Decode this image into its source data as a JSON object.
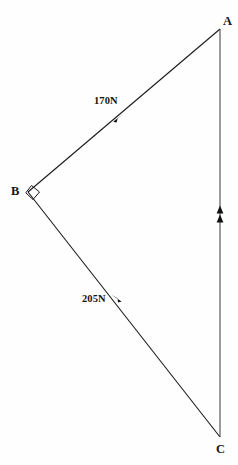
{
  "figure": {
    "background_color": "#fefefe",
    "stroke_color": "#1a1a1a",
    "width": 238,
    "height": 465
  },
  "vertices": [
    {
      "id": "A",
      "label": "A",
      "x": 220,
      "y": 29
    },
    {
      "id": "B",
      "label": "B",
      "x": 28,
      "y": 192
    },
    {
      "id": "C",
      "label": "C",
      "x": 220,
      "y": 437
    }
  ],
  "right_angle": {
    "at_vertex": "B",
    "marker": "square",
    "label": ""
  },
  "edges": [
    {
      "id": "BA",
      "from": "B",
      "to": "A",
      "label": "170N",
      "magnitude": 170,
      "unit": "N",
      "arrow_direction": "toward-A",
      "arrow_count": 1
    },
    {
      "id": "CB",
      "from": "C",
      "to": "B",
      "label": "205N",
      "magnitude": 205,
      "unit": "N",
      "arrow_direction": "toward-B",
      "arrow_count": 1
    },
    {
      "id": "CA",
      "from": "C",
      "to": "A",
      "label": "",
      "magnitude": null,
      "unit": "N",
      "arrow_direction": "toward-A",
      "arrow_count": 2
    }
  ]
}
